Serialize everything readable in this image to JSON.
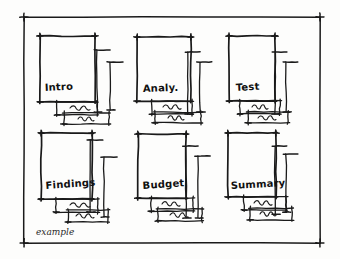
{
  "figure": {
    "kind": "hand-drawn-wireframe-sketch",
    "caption": "example",
    "ink_color": "#1a1a1a",
    "paper_color": "#fdfdfc",
    "grid_rows": 2,
    "grid_columns": 3
  },
  "panels": [
    {
      "id": "panel-intro",
      "label": "Intro",
      "row": 1,
      "column": 1,
      "label_x": 45,
      "label_y": 92,
      "label_rotate": -3,
      "box": {
        "x": 40,
        "y": 36,
        "w": 55,
        "h": 66
      },
      "brackets": [
        {
          "x": 97,
          "y": 50,
          "h": 62,
          "cap": 13
        },
        {
          "x": 110,
          "y": 62,
          "h": 48,
          "cap": 13
        }
      ],
      "subboxes": [
        {
          "x": 57,
          "y": 102,
          "w": 40,
          "h": 13
        },
        {
          "x": 64,
          "y": 113,
          "w": 45,
          "h": 11
        }
      ],
      "squiggles": [
        {
          "x": 70,
          "y": 108,
          "w": 20
        },
        {
          "x": 78,
          "y": 119,
          "w": 16
        }
      ]
    },
    {
      "id": "panel-analy",
      "label": "Analy.",
      "row": 1,
      "column": 2,
      "label_x": 143,
      "label_y": 93,
      "label_rotate": -2,
      "box": {
        "x": 137,
        "y": 37,
        "w": 54,
        "h": 64
      },
      "brackets": [
        {
          "x": 188,
          "y": 52,
          "h": 62,
          "cap": 12
        },
        {
          "x": 200,
          "y": 62,
          "h": 50,
          "cap": 12
        }
      ],
      "subboxes": [
        {
          "x": 152,
          "y": 101,
          "w": 40,
          "h": 13
        },
        {
          "x": 155,
          "y": 112,
          "w": 46,
          "h": 11
        }
      ],
      "squiggles": [
        {
          "x": 163,
          "y": 107,
          "w": 18
        },
        {
          "x": 168,
          "y": 118,
          "w": 16
        }
      ]
    },
    {
      "id": "panel-test",
      "label": "Test",
      "row": 1,
      "column": 3,
      "label_x": 236,
      "label_y": 92,
      "label_rotate": -3,
      "box": {
        "x": 229,
        "y": 36,
        "w": 46,
        "h": 65
      },
      "brackets": [
        {
          "x": 275,
          "y": 52,
          "h": 62,
          "cap": 12
        },
        {
          "x": 286,
          "y": 62,
          "h": 50,
          "cap": 12
        }
      ],
      "subboxes": [
        {
          "x": 240,
          "y": 101,
          "w": 40,
          "h": 13
        },
        {
          "x": 248,
          "y": 112,
          "w": 40,
          "h": 11
        }
      ],
      "squiggles": [
        {
          "x": 252,
          "y": 107,
          "w": 16
        },
        {
          "x": 258,
          "y": 118,
          "w": 18
        }
      ]
    },
    {
      "id": "panel-findings",
      "label": "Findings",
      "row": 2,
      "column": 1,
      "label_x": 46,
      "label_y": 190,
      "label_rotate": -4,
      "box": {
        "x": 41,
        "y": 133,
        "w": 51,
        "h": 66
      },
      "brackets": [
        {
          "x": 90,
          "y": 140,
          "h": 72,
          "cap": 13
        },
        {
          "x": 104,
          "y": 157,
          "h": 60,
          "cap": 13
        }
      ],
      "subboxes": [
        {
          "x": 56,
          "y": 199,
          "w": 42,
          "h": 13
        },
        {
          "x": 68,
          "y": 210,
          "w": 40,
          "h": 12
        }
      ],
      "squiggles": [
        {
          "x": 70,
          "y": 205,
          "w": 20
        },
        {
          "x": 76,
          "y": 216,
          "w": 18
        }
      ]
    },
    {
      "id": "panel-budget",
      "label": "Budget",
      "row": 2,
      "column": 2,
      "label_x": 143,
      "label_y": 190,
      "label_rotate": -4,
      "box": {
        "x": 138,
        "y": 134,
        "w": 48,
        "h": 64
      },
      "brackets": [
        {
          "x": 186,
          "y": 146,
          "h": 72,
          "cap": 12
        },
        {
          "x": 198,
          "y": 156,
          "h": 62,
          "cap": 12
        }
      ],
      "subboxes": [
        {
          "x": 151,
          "y": 198,
          "w": 42,
          "h": 13
        },
        {
          "x": 158,
          "y": 209,
          "w": 44,
          "h": 12
        }
      ],
      "squiggles": [
        {
          "x": 162,
          "y": 204,
          "w": 18
        },
        {
          "x": 170,
          "y": 215,
          "w": 18
        }
      ]
    },
    {
      "id": "panel-summary",
      "label": "Summary",
      "row": 2,
      "column": 3,
      "label_x": 231,
      "label_y": 190,
      "label_rotate": -3,
      "box": {
        "x": 228,
        "y": 133,
        "w": 48,
        "h": 64
      },
      "brackets": [
        {
          "x": 275,
          "y": 146,
          "h": 68,
          "cap": 12
        },
        {
          "x": 286,
          "y": 154,
          "h": 58,
          "cap": 12
        }
      ],
      "subboxes": [
        {
          "x": 244,
          "y": 197,
          "w": 42,
          "h": 13
        },
        {
          "x": 250,
          "y": 208,
          "w": 42,
          "h": 12
        }
      ],
      "squiggles": [
        {
          "x": 254,
          "y": 203,
          "w": 18
        },
        {
          "x": 260,
          "y": 214,
          "w": 16
        }
      ]
    }
  ],
  "frame": {
    "left": 24,
    "top": 17,
    "right": 320,
    "bottom": 243
  }
}
